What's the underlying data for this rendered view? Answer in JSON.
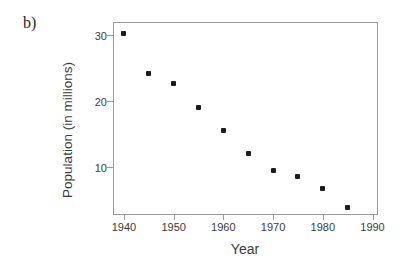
{
  "figure": {
    "part_label": "b)"
  },
  "chart_data": {
    "type": "scatter",
    "title": "",
    "xlabel": "Year",
    "ylabel": "Population (in millions)",
    "x": [
      1940,
      1945,
      1950,
      1955,
      1960,
      1965,
      1970,
      1975,
      1980,
      1985
    ],
    "y": [
      30.3,
      24.2,
      22.7,
      19.1,
      15.5,
      12.1,
      9.4,
      8.5,
      6.8,
      3.9
    ],
    "x_ticks": [
      1940,
      1950,
      1960,
      1970,
      1980,
      1990
    ],
    "y_ticks": [
      10,
      20,
      30
    ],
    "xlim": [
      1937.8,
      1990.9
    ],
    "ylim": [
      2.85,
      32.05
    ],
    "grid": false,
    "legend": "none",
    "marker": "filled-square",
    "marker_color": "#1c1c1c",
    "frame_color": "#9a9a9a",
    "text_color": "#3a3a3a"
  }
}
